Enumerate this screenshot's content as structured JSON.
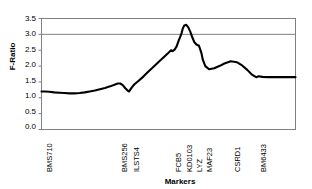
{
  "chart_data": {
    "type": "line",
    "title": "",
    "xlabel": "Markers",
    "ylabel": "F-Ratio",
    "ylim": [
      0.0,
      3.5
    ],
    "yticks": [
      "0.0",
      "0.5",
      "1.0",
      "1.5",
      "2.0",
      "2.5",
      "3.0",
      "3.5"
    ],
    "ytick_values": [
      0.0,
      0.5,
      1.0,
      1.5,
      2.0,
      2.5,
      3.0,
      3.5
    ],
    "grid": false,
    "legend": "none",
    "threshold_line": {
      "value": 3.0,
      "color": "#808080",
      "label": ""
    },
    "marker_labels": [
      "BMS710",
      "BMS256",
      "ILSTS4",
      "FCB5",
      "KD0103",
      "LYZ",
      "MAF23",
      "CSRD1",
      "BM6433"
    ],
    "marker_positions": [
      0.5,
      30.0,
      34.5,
      51.0,
      55.5,
      59.5,
      63.5,
      74.5,
      84.5
    ],
    "marker_f_ratios": [
      1.2,
      1.45,
      1.2,
      2.5,
      3.3,
      2.62,
      1.9,
      2.15,
      1.65
    ],
    "series": [
      {
        "name": "F-Ratio",
        "color": "#000000",
        "x": [
          0.0,
          1.5,
          3.0,
          5.0,
          7.0,
          9.0,
          11.0,
          13.0,
          15.0,
          17.0,
          19.0,
          21.0,
          23.0,
          25.0,
          27.0,
          29.0,
          30.0,
          31.0,
          32.0,
          33.0,
          34.0,
          34.5,
          35.5,
          36.5,
          38.0,
          40.0,
          42.0,
          44.0,
          46.0,
          48.0,
          50.0,
          51.0,
          51.6,
          52.4,
          53.2,
          54.0,
          54.6,
          55.2,
          55.6,
          56.2,
          57.0,
          57.8,
          58.6,
          59.4,
          60.2,
          61.0,
          62.0,
          63.0,
          63.5,
          64.5,
          66.0,
          68.0,
          70.0,
          72.0,
          74.5,
          77.0,
          79.0,
          81.0,
          83.0,
          84.5,
          85.5,
          87.0,
          89.0,
          92.0,
          96.0,
          100.0
        ],
        "y": [
          1.2,
          1.2,
          1.19,
          1.17,
          1.16,
          1.15,
          1.14,
          1.14,
          1.15,
          1.17,
          1.2,
          1.23,
          1.27,
          1.31,
          1.36,
          1.42,
          1.45,
          1.45,
          1.4,
          1.3,
          1.22,
          1.2,
          1.32,
          1.42,
          1.52,
          1.66,
          1.82,
          1.97,
          2.12,
          2.27,
          2.42,
          2.5,
          2.47,
          2.52,
          2.62,
          2.8,
          2.92,
          3.05,
          3.18,
          3.28,
          3.3,
          3.22,
          3.08,
          2.9,
          2.75,
          2.68,
          2.64,
          2.4,
          2.2,
          2.0,
          1.9,
          1.93,
          2.0,
          2.08,
          2.15,
          2.12,
          2.02,
          1.88,
          1.72,
          1.65,
          1.68,
          1.66,
          1.65,
          1.65,
          1.65,
          1.65
        ]
      }
    ]
  },
  "frame": {
    "border_color": "#808080",
    "plot_background": "#ffffff"
  }
}
